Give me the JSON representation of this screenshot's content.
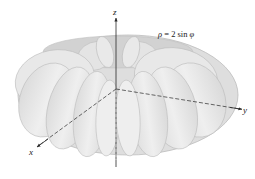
{
  "figure": {
    "equation": "ρ = 2 sin φ",
    "equation_parts": {
      "rho": "ρ",
      "equals": " = 2 sin ",
      "phi": "φ"
    },
    "axes": {
      "z": "z",
      "y": "y",
      "x": "x"
    },
    "surface": {
      "name": "spindle torus",
      "fill": "#e6e6e6",
      "lobe_fill": "#ececec",
      "edge": "#b8b8b8",
      "inner_shade": "#c9c9c9"
    },
    "axis_color": "#2a2a2a"
  }
}
